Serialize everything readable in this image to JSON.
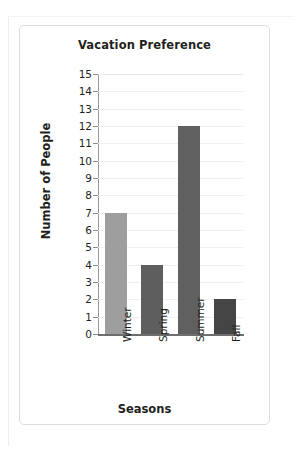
{
  "chart_data": {
    "type": "bar",
    "title": "Vacation Preference",
    "xlabel": "Seasons",
    "ylabel": "Number of People",
    "categories": [
      "Winter",
      "Spring",
      "Summer",
      "Fall"
    ],
    "values": [
      7,
      4,
      12,
      2
    ],
    "bar_colors": [
      "#9e9e9e",
      "#5e5e5e",
      "#606060",
      "#454545"
    ],
    "ylim": [
      0,
      15
    ],
    "ytick_step": 1,
    "yticks": [
      15,
      14,
      13,
      12,
      11,
      10,
      9,
      8,
      7,
      6,
      5,
      4,
      3,
      2,
      1,
      0
    ],
    "ytick_labels": [
      "15",
      "14",
      "13",
      "12",
      "11",
      "10",
      "9",
      "8",
      "7",
      "6",
      "5",
      "4",
      "3",
      "2",
      "1",
      "0"
    ],
    "grid": true,
    "grid_color": "#f0f0f0",
    "axis_color": "#6e6e6e",
    "legend": null,
    "legend_position": "none",
    "xtick_rotation": 90,
    "background": "#ffffff"
  },
  "card": {
    "border_color": "#dcdddd",
    "background": "#ffffff"
  }
}
